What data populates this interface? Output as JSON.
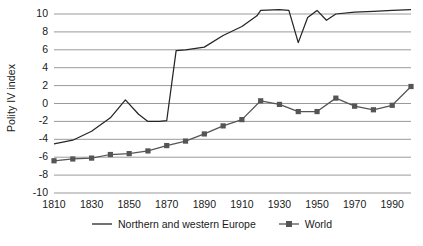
{
  "chart_data": {
    "type": "line",
    "title": "",
    "xlabel": "",
    "ylabel": "Polity IV index",
    "xlim": [
      1810,
      2000
    ],
    "ylim": [
      -10,
      10
    ],
    "grid": true,
    "legend_position": "bottom",
    "yticks": [
      "10",
      "8",
      "6",
      "4",
      "2",
      "0",
      "-2",
      "-4",
      "-6",
      "-8",
      "-10"
    ],
    "ytick_values": [
      10,
      8,
      6,
      4,
      2,
      0,
      -2,
      -4,
      -6,
      -8,
      -10
    ],
    "xticks": [
      "1810",
      "1830",
      "1850",
      "1870",
      "1890",
      "1910",
      "1930",
      "1950",
      "1970",
      "1990"
    ],
    "xtick_values": [
      1810,
      1830,
      1850,
      1870,
      1890,
      1910,
      1930,
      1950,
      1970,
      1990
    ],
    "series": [
      {
        "name": "Northern and western Europe",
        "style": "line",
        "color": "#262626",
        "marker": "none",
        "x": [
          1810,
          1820,
          1830,
          1840,
          1848,
          1855,
          1860,
          1866,
          1870,
          1875,
          1880,
          1890,
          1900,
          1910,
          1918,
          1920,
          1930,
          1935,
          1940,
          1945,
          1950,
          1955,
          1960,
          1970,
          1980,
          1990,
          2000
        ],
        "values": [
          -4.5,
          -4.1,
          -3.1,
          -1.6,
          0.4,
          -1.2,
          -2.0,
          -2.0,
          -1.9,
          5.9,
          6.0,
          6.3,
          7.6,
          8.6,
          9.8,
          10.4,
          10.5,
          10.4,
          6.8,
          9.6,
          10.4,
          9.3,
          10.0,
          10.2,
          10.3,
          10.4,
          10.5
        ]
      },
      {
        "name": "World",
        "style": "line-marker",
        "color": "#555555",
        "marker": "square",
        "x": [
          1810,
          1820,
          1830,
          1840,
          1850,
          1860,
          1870,
          1880,
          1890,
          1900,
          1910,
          1920,
          1930,
          1940,
          1950,
          1960,
          1970,
          1980,
          1990,
          2000
        ],
        "values": [
          -6.4,
          -6.2,
          -6.1,
          -5.7,
          -5.6,
          -5.3,
          -4.7,
          -4.2,
          -3.4,
          -2.5,
          -1.8,
          0.3,
          -0.1,
          -0.9,
          -0.9,
          0.6,
          -0.3,
          -0.7,
          -0.2,
          1.9
        ]
      }
    ]
  },
  "legend": {
    "entries": [
      {
        "label": "Northern and western Europe"
      },
      {
        "label": "World"
      }
    ]
  }
}
